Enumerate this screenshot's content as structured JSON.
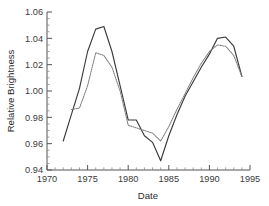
{
  "chart_data": {
    "type": "line",
    "title": "",
    "xlabel": "Date",
    "ylabel": "Relative Brightness",
    "xlim": [
      1970,
      1995
    ],
    "ylim": [
      0.94,
      1.06
    ],
    "xticks": [
      1970,
      1975,
      1980,
      1985,
      1990,
      1995
    ],
    "xtick_labels": [
      "1970",
      "1975",
      "1980",
      "1985",
      "1990",
      "1995"
    ],
    "yticks": [
      0.94,
      0.96,
      0.98,
      1.0,
      1.02,
      1.04,
      1.06
    ],
    "ytick_labels": [
      "0.94",
      "0.96",
      "0.98",
      "1.00",
      "1.02",
      "1.04",
      "1.06"
    ],
    "xminor_step": 1,
    "yminor_step": 0.005,
    "grid": false,
    "legend": "none",
    "series": [
      {
        "name": "solid",
        "style": "solid",
        "color": "#3b3b3b",
        "x": [
          1972,
          1973,
          1974,
          1975,
          1976,
          1977,
          1978,
          1979,
          1980,
          1981,
          1982,
          1983,
          1984,
          1985,
          1986,
          1987,
          1988,
          1989,
          1990,
          1991,
          1992,
          1993,
          1994
        ],
        "y": [
          0.962,
          0.982,
          1.002,
          1.03,
          1.047,
          1.049,
          1.03,
          1.004,
          0.978,
          0.978,
          0.966,
          0.961,
          0.947,
          0.966,
          0.982,
          0.996,
          1.007,
          1.018,
          1.028,
          1.04,
          1.041,
          1.034,
          1.011
        ]
      },
      {
        "name": "dotted",
        "style": "dotted",
        "color": "#7d7d7d",
        "x": [
          1973,
          1974,
          1975,
          1976,
          1977,
          1978,
          1979,
          1980,
          1981,
          1982,
          1983,
          1984,
          1985,
          1986,
          1987,
          1988,
          1989,
          1990,
          1991,
          1992,
          1993,
          1994
        ],
        "y": [
          0.986,
          0.987,
          1.004,
          1.029,
          1.027,
          1.018,
          1.0,
          0.974,
          0.972,
          0.97,
          0.968,
          0.962,
          0.973,
          0.986,
          0.998,
          1.01,
          1.021,
          1.03,
          1.035,
          1.034,
          1.027,
          1.011
        ]
      }
    ]
  },
  "axes": {
    "x_title": "Date",
    "y_title": "Relative Brightness"
  }
}
